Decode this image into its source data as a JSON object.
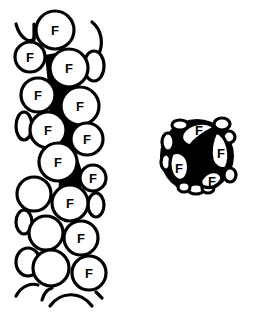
{
  "figure": {
    "cell_label": "F",
    "colors": {
      "ink": "#000000",
      "background": "#ffffff"
    },
    "longitudinal_view": {
      "labeled_cells": [
        "F",
        "F",
        "F",
        "F",
        "F",
        "F",
        "F",
        "F",
        "F",
        "F",
        "F",
        "F"
      ]
    },
    "cross_section_view": {
      "labeled_cells": [
        "F",
        "F",
        "F",
        "F"
      ]
    }
  }
}
